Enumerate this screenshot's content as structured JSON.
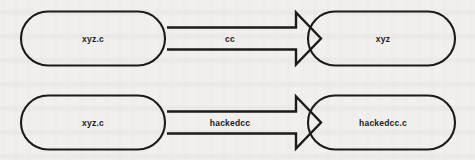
{
  "diagram": {
    "type": "flow-diagram",
    "background_color": "#f1f0ee",
    "stroke_color": "#1b1b1b",
    "text_color": "#1c1c1c",
    "rows": [
      {
        "source": {
          "label": "xyz.c",
          "shape": "stadium"
        },
        "edge": {
          "label": "cc",
          "shape": "block-arrow",
          "direction": "right"
        },
        "target": {
          "label": "xyz",
          "shape": "stadium"
        }
      },
      {
        "source": {
          "label": "xyz.c",
          "shape": "stadium"
        },
        "edge": {
          "label": "hackedcc",
          "shape": "block-arrow",
          "direction": "right"
        },
        "target": {
          "label": "hackedcc.c",
          "shape": "stadium"
        }
      }
    ]
  }
}
